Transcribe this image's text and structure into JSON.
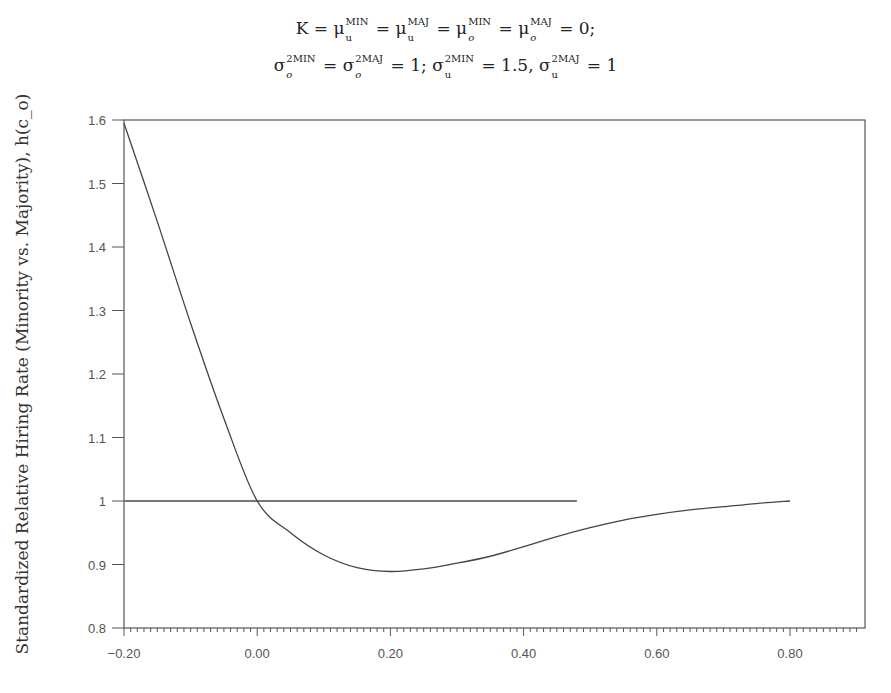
{
  "title": {
    "line1": {
      "K": "K",
      "eq": "=",
      "terms": [
        {
          "sym": "μ",
          "sup": "MIN",
          "sub": "u"
        },
        {
          "sym": "μ",
          "sup": "MAJ",
          "sub": "u"
        },
        {
          "sym": "μ",
          "sup": "MIN",
          "sub": "o"
        },
        {
          "sym": "μ",
          "sup": "MAJ",
          "sub": "o"
        }
      ],
      "value": "0;"
    },
    "line2": {
      "terms": [
        {
          "sym": "σ",
          "sup": "2MIN",
          "sub": "o",
          "after": "="
        },
        {
          "sym": "σ",
          "sup": "2MAJ",
          "sub": "o",
          "after": "= 1;"
        },
        {
          "sym": "σ",
          "sup": "2MIN",
          "sub": "u",
          "after": "= 1.5,"
        },
        {
          "sym": "σ",
          "sup": "2MAJ",
          "sub": "u",
          "after": "= 1"
        }
      ]
    }
  },
  "chart_data": {
    "type": "line",
    "xlabel": "",
    "ylabel": "Standardized Relative Hiring Rate (Minority vs. Majority), h(c_o)",
    "xlim": [
      -0.2,
      0.9
    ],
    "ylim": [
      0.8,
      1.6
    ],
    "x_ticks": [
      "-0.20",
      "0.00",
      "0.20",
      "0.40",
      "0.60",
      "0.80"
    ],
    "y_ticks": [
      "0.8",
      "0.9",
      "1",
      "1.1",
      "1.2",
      "1.3",
      "1.4",
      "1.5",
      "1.6"
    ],
    "grid": false,
    "legend": null,
    "series": [
      {
        "name": "h(c_o)",
        "x": [
          -0.2,
          -0.15,
          -0.1,
          -0.05,
          0.0,
          0.05,
          0.1,
          0.15,
          0.2,
          0.25,
          0.3,
          0.35,
          0.4,
          0.45,
          0.5,
          0.55,
          0.6,
          0.65,
          0.7,
          0.75,
          0.8
        ],
        "y": [
          1.595,
          1.44,
          1.28,
          1.13,
          1.0,
          0.95,
          0.915,
          0.895,
          0.889,
          0.893,
          0.902,
          0.913,
          0.928,
          0.944,
          0.958,
          0.97,
          0.979,
          0.986,
          0.991,
          0.996,
          1.0
        ]
      },
      {
        "name": "reference line y=1",
        "x": [
          -0.2,
          0.48
        ],
        "y": [
          1.0,
          1.0
        ]
      }
    ]
  }
}
